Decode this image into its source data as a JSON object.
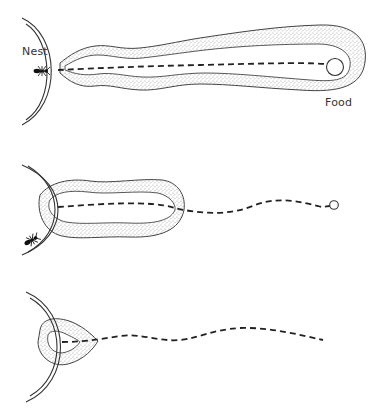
{
  "figure": {
    "panels": [
      {
        "id": "panel-1",
        "labels": {
          "nest": "Nest",
          "food": "Food"
        },
        "description": "Long pheromone trail from nest to food source"
      },
      {
        "id": "panel-2",
        "description": "Trail retracted into loop near nest; dashed path continues to food"
      },
      {
        "id": "panel-3",
        "description": "Small trail near nest entrance; dashed path extends outward"
      }
    ],
    "colors": {
      "line": "#333333",
      "stipple": "#c8c8c8",
      "background": "#ffffff"
    }
  }
}
